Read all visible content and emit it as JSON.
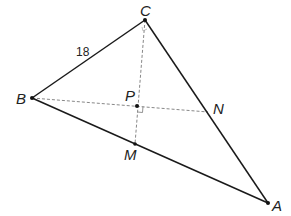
{
  "diagram": {
    "type": "geometry-triangle",
    "points": {
      "A": {
        "label": "A",
        "x": 268,
        "y": 203
      },
      "B": {
        "label": "B",
        "x": 32,
        "y": 98
      },
      "C": {
        "label": "C",
        "x": 145,
        "y": 20
      },
      "P": {
        "label": "P",
        "x": 137,
        "y": 106
      },
      "N": {
        "label": "N",
        "x": 208,
        "y": 112
      },
      "M": {
        "label": "M",
        "x": 135,
        "y": 144
      }
    },
    "side_label_BC": "18",
    "segments": [
      {
        "from": "B",
        "to": "C",
        "style": "solid"
      },
      {
        "from": "C",
        "to": "A",
        "style": "solid"
      },
      {
        "from": "B",
        "to": "A",
        "style": "solid"
      },
      {
        "from": "B",
        "to": "N",
        "style": "dashed"
      },
      {
        "from": "C",
        "to": "M",
        "style": "dashed"
      }
    ],
    "right_angle_markers": [
      "P",
      "C"
    ]
  }
}
